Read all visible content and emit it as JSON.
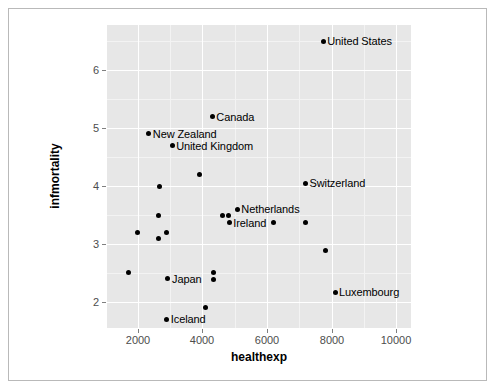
{
  "chart_data": {
    "type": "scatter",
    "title": "",
    "xlabel": "healthexp",
    "ylabel": "infmortality",
    "xlim": [
      1050,
      10450
    ],
    "ylim": [
      1.55,
      6.78
    ],
    "xticks": [
      2000,
      4000,
      6000,
      8000,
      10000
    ],
    "yticks": [
      2,
      3,
      4,
      5,
      6
    ],
    "grid": true,
    "legend": "none",
    "panel_color": "#e7e7e7",
    "point_color": "#000000",
    "points": [
      {
        "label": "United States",
        "x": 7736,
        "y": 6.5,
        "label_side": "right"
      },
      {
        "label": "Canada",
        "x": 4306,
        "y": 5.2,
        "label_side": "right"
      },
      {
        "label": "New Zealand",
        "x": 2343,
        "y": 4.9,
        "label_side": "right"
      },
      {
        "label": "United Kingdom",
        "x": 3064,
        "y": 4.7,
        "label_side": "right"
      },
      {
        "label": "",
        "x": 3907,
        "y": 4.2,
        "label_side": "right"
      },
      {
        "label": "Switzerland",
        "x": 7187,
        "y": 4.05,
        "label_side": "right"
      },
      {
        "label": "",
        "x": 2673,
        "y": 4.0,
        "label_side": "right"
      },
      {
        "label": "Netherlands",
        "x": 5080,
        "y": 3.6,
        "label_side": "right"
      },
      {
        "label": "",
        "x": 2643,
        "y": 3.5,
        "label_side": "right"
      },
      {
        "label": "",
        "x": 4611,
        "y": 3.5,
        "label_side": "right"
      },
      {
        "label": "",
        "x": 4800,
        "y": 3.5,
        "label_side": "right"
      },
      {
        "label": "Ireland",
        "x": 4832,
        "y": 3.37,
        "label_side": "right"
      },
      {
        "label": "",
        "x": 6200,
        "y": 3.37,
        "label_side": "right"
      },
      {
        "label": "",
        "x": 7187,
        "y": 3.37,
        "label_side": "right"
      },
      {
        "label": "",
        "x": 2000,
        "y": 3.2,
        "label_side": "right"
      },
      {
        "label": "",
        "x": 2884,
        "y": 3.2,
        "label_side": "right"
      },
      {
        "label": "",
        "x": 2643,
        "y": 3.1,
        "label_side": "right"
      },
      {
        "label": "",
        "x": 7800,
        "y": 2.88,
        "label_side": "right"
      },
      {
        "label": "",
        "x": 1700,
        "y": 2.5,
        "label_side": "right"
      },
      {
        "label": "",
        "x": 4340,
        "y": 2.5,
        "label_side": "right"
      },
      {
        "label": "Japan",
        "x": 2936,
        "y": 2.4,
        "label_side": "right"
      },
      {
        "label": "",
        "x": 4340,
        "y": 2.38,
        "label_side": "right"
      },
      {
        "label": "Luxembourg",
        "x": 8100,
        "y": 2.17,
        "label_side": "right"
      },
      {
        "label": "",
        "x": 4100,
        "y": 1.9,
        "label_side": "right"
      },
      {
        "label": "Iceland",
        "x": 2900,
        "y": 1.7,
        "label_side": "right"
      }
    ]
  },
  "axes": {
    "x_title": "healthexp",
    "y_title": "infmortality",
    "x_tick_labels": [
      "2000",
      "4000",
      "6000",
      "8000",
      "10000"
    ],
    "y_tick_labels": [
      "2",
      "3",
      "4",
      "5",
      "6"
    ]
  }
}
